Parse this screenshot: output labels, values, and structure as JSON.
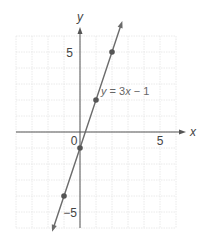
{
  "chart_data": {
    "type": "line",
    "title": "",
    "xlabel": "x",
    "ylabel": "y",
    "xlim": [
      -4,
      6
    ],
    "ylim": [
      -6,
      6
    ],
    "grid": true,
    "x_ticks_labeled": [
      0,
      5
    ],
    "y_ticks_labeled": [
      5,
      -5
    ],
    "series": [
      {
        "name": "y = 3x − 1",
        "equation": "y = 3x - 1",
        "slope": 3,
        "intercept": -1,
        "points": [
          [
            -1,
            -4
          ],
          [
            0,
            -1
          ],
          [
            1,
            2
          ],
          [
            2,
            5
          ]
        ],
        "color": "#6b6b6b"
      }
    ],
    "annotations": [
      {
        "text": "y = 3x − 1",
        "x": 1.3,
        "y": 2.1
      }
    ]
  },
  "labels": {
    "x_axis": "x",
    "y_axis": "y",
    "origin": "0",
    "x_five": "5",
    "y_five": "5",
    "y_neg_five": "−5",
    "equation_y": "y",
    "equation_rest": " = 3",
    "equation_x": "x",
    "equation_tail": " − 1"
  },
  "colors": {
    "grid": "#e4e4e4",
    "axis": "#555555",
    "line": "#6b6b6b",
    "point": "#555555",
    "text": "#444444"
  }
}
